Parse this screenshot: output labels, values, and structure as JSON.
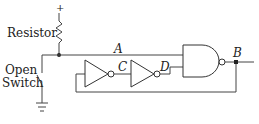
{
  "diagram": {
    "type": "logic-circuit",
    "labels": {
      "plus": "+",
      "resistor": "Resistor",
      "switch_line1": "Open",
      "switch_line2": "Switch",
      "node_a": "A",
      "node_b": "B",
      "node_c": "C",
      "node_d": "D"
    },
    "components": [
      {
        "name": "resistor",
        "kind": "resistor"
      },
      {
        "name": "open-switch",
        "kind": "switch",
        "state": "open"
      },
      {
        "name": "ground",
        "kind": "ground"
      },
      {
        "name": "inverter-1",
        "kind": "NOT",
        "output": "C"
      },
      {
        "name": "inverter-2",
        "kind": "NOT",
        "input": "C",
        "output": "D"
      },
      {
        "name": "nand-gate",
        "kind": "NAND",
        "inputs": [
          "A",
          "D"
        ],
        "output": "B"
      }
    ],
    "colors": {
      "stroke": "#444444",
      "background": "#ffffff"
    }
  }
}
